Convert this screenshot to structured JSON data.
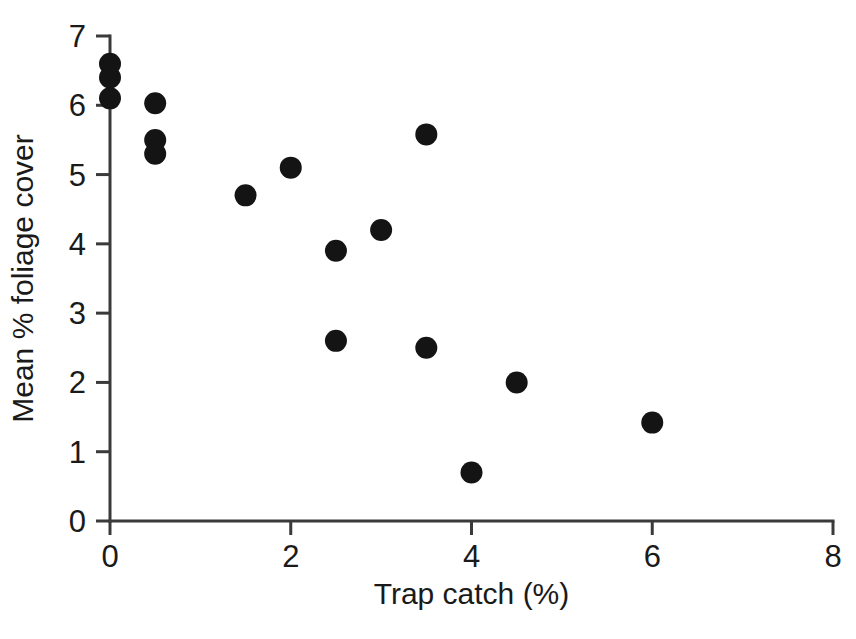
{
  "chart_data": {
    "type": "scatter",
    "title": "",
    "xlabel": "Trap catch (%)",
    "ylabel": "Mean % foliage cover",
    "xlim": [
      0,
      8
    ],
    "ylim": [
      0,
      7
    ],
    "xticks": [
      0,
      2,
      4,
      6,
      8
    ],
    "yticks": [
      0,
      1,
      2,
      3,
      4,
      5,
      6,
      7
    ],
    "xtick_labels": [
      "0",
      "2",
      "4",
      "6",
      "8"
    ],
    "ytick_labels": [
      "0",
      "1",
      "2",
      "3",
      "4",
      "5",
      "6",
      "7"
    ],
    "grid": false,
    "legend": null,
    "marker": {
      "shape": "circle",
      "color": "#141414",
      "size_px": 22
    },
    "series": [
      {
        "name": "Trap catch vs mean % foliage cover",
        "points": [
          {
            "x": 0.0,
            "y": 6.6
          },
          {
            "x": 0.0,
            "y": 6.4
          },
          {
            "x": 0.0,
            "y": 6.1
          },
          {
            "x": 0.5,
            "y": 6.03
          },
          {
            "x": 0.5,
            "y": 5.5
          },
          {
            "x": 0.5,
            "y": 5.3
          },
          {
            "x": 1.5,
            "y": 4.7
          },
          {
            "x": 2.0,
            "y": 5.1
          },
          {
            "x": 2.5,
            "y": 3.9
          },
          {
            "x": 2.5,
            "y": 2.6
          },
          {
            "x": 3.0,
            "y": 4.2
          },
          {
            "x": 3.5,
            "y": 5.58
          },
          {
            "x": 3.5,
            "y": 2.5
          },
          {
            "x": 4.0,
            "y": 0.7
          },
          {
            "x": 4.5,
            "y": 2.0
          },
          {
            "x": 6.0,
            "y": 1.42
          }
        ]
      }
    ],
    "colors": {
      "axis": "#3a3a3a",
      "text": "#1a1a1a",
      "marker": "#141414",
      "background": "#ffffff"
    }
  }
}
